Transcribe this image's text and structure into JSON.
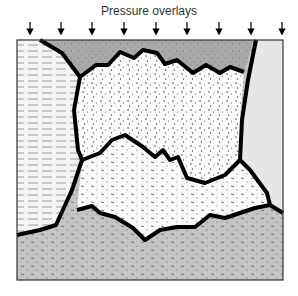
{
  "diagram": {
    "title": "Pressure overlays",
    "arrow_count": 9,
    "arrow_x": [
      30,
      61,
      92,
      124,
      156,
      187,
      219,
      251,
      282
    ],
    "regions": [
      {
        "name": "top-grey-layer",
        "fill": "#a9a9a9",
        "pattern": "fine-dots"
      },
      {
        "name": "left-layered-region",
        "fill": "#f4f4f4",
        "pattern": "horizontal-dashes"
      },
      {
        "name": "upper-dotted-region",
        "fill": "#fbfbfb",
        "pattern": "coarse-dots"
      },
      {
        "name": "right-light-grey-region",
        "fill": "#e4e4e4",
        "pattern": "none"
      },
      {
        "name": "middle-dotted-region",
        "fill": "#fafafa",
        "pattern": "dashes-and-dots"
      },
      {
        "name": "bottom-grey-layer",
        "fill": "#c4c4c4",
        "pattern": "dashes-and-dots"
      }
    ],
    "colors": {
      "boundary": "#000000",
      "frame": "#333333"
    }
  }
}
